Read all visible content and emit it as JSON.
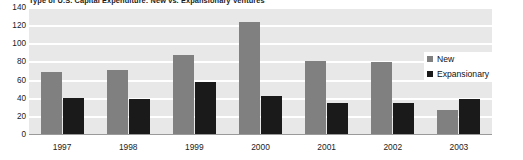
{
  "chart_data": {
    "type": "bar",
    "title": "Type of U.S. Capital Expenditure: New vs. Expansionary Ventures",
    "xlabel": "",
    "ylabel": "",
    "ylim": [
      0,
      140
    ],
    "yticks": [
      140,
      120,
      100,
      80,
      60,
      40,
      20,
      0
    ],
    "grid": true,
    "legend_position": "right",
    "categories": [
      "1997",
      "1998",
      "1999",
      "2000",
      "2001",
      "2002",
      "2003"
    ],
    "series": [
      {
        "name": "New",
        "color": "#808080",
        "values": [
          69,
          72,
          88,
          125,
          82,
          80,
          28
        ]
      },
      {
        "name": "Expansionary",
        "color": "#1a1a1a",
        "values": [
          41,
          40,
          58,
          43,
          35,
          35,
          40
        ]
      }
    ]
  },
  "legend": {
    "items": [
      {
        "label": "New",
        "swatch": "new"
      },
      {
        "label": "Expansionary",
        "swatch": "exp"
      }
    ]
  },
  "colors": {
    "new": "#808080",
    "expansionary": "#1a1a1a",
    "plot_background": "#e8e8e8",
    "gridline": "#ffffff",
    "page_background": "#ffffff"
  }
}
